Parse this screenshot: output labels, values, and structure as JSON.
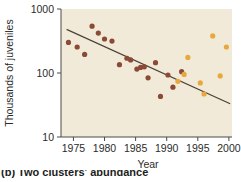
{
  "figure": {
    "background_color": "#ffffff",
    "plot_background_color": "#f2ead9",
    "caption_partial": "(b) Two clusters' abundance"
  },
  "chart_data": {
    "type": "scatter",
    "title": "",
    "xlabel": "Year",
    "ylabel": "Thousands of juveniles",
    "xlim": [
      1973,
      2000.5
    ],
    "ylim": [
      10,
      1000
    ],
    "yscale": "log",
    "xscale": "linear",
    "xticks": [
      1975,
      1980,
      1985,
      1990,
      1995,
      2000
    ],
    "xtick_labels": [
      "1975",
      "1980",
      "1985",
      "1990",
      "1995",
      "2000"
    ],
    "yticks": [
      10,
      100,
      1000
    ],
    "ytick_labels": [
      "10",
      "100",
      "1000"
    ],
    "grid": false,
    "legend": "none",
    "series": [
      {
        "name": "early-period",
        "color": "#8a4a35",
        "marker": "circle",
        "points": [
          {
            "x": 1974.2,
            "y": 300
          },
          {
            "x": 1975.6,
            "y": 255
          },
          {
            "x": 1976.8,
            "y": 195
          },
          {
            "x": 1978.0,
            "y": 540
          },
          {
            "x": 1979.0,
            "y": 420
          },
          {
            "x": 1980.0,
            "y": 340
          },
          {
            "x": 1981.2,
            "y": 315
          },
          {
            "x": 1982.4,
            "y": 135
          },
          {
            "x": 1983.6,
            "y": 170
          },
          {
            "x": 1984.2,
            "y": 160
          },
          {
            "x": 1985.2,
            "y": 115
          },
          {
            "x": 1985.8,
            "y": 122
          },
          {
            "x": 1986.4,
            "y": 125
          },
          {
            "x": 1987.0,
            "y": 84
          },
          {
            "x": 1988.2,
            "y": 145
          },
          {
            "x": 1989.0,
            "y": 43
          },
          {
            "x": 1990.2,
            "y": 93
          },
          {
            "x": 1991.0,
            "y": 60
          },
          {
            "x": 1992.4,
            "y": 105
          }
        ]
      },
      {
        "name": "late-period",
        "color": "#e8a83c",
        "marker": "circle",
        "points": [
          {
            "x": 1991.8,
            "y": 74
          },
          {
            "x": 1992.8,
            "y": 95
          },
          {
            "x": 1993.4,
            "y": 175
          },
          {
            "x": 1995.4,
            "y": 70
          },
          {
            "x": 1996.0,
            "y": 47
          },
          {
            "x": 1997.4,
            "y": 380
          },
          {
            "x": 1998.6,
            "y": 90
          },
          {
            "x": 1999.6,
            "y": 255
          }
        ]
      }
    ],
    "trend_line": {
      "name": "regression-line",
      "color": "#4b4037",
      "x_start": 1973.9,
      "y_start": 480,
      "x_end": 2000.2,
      "y_end": 33
    }
  }
}
